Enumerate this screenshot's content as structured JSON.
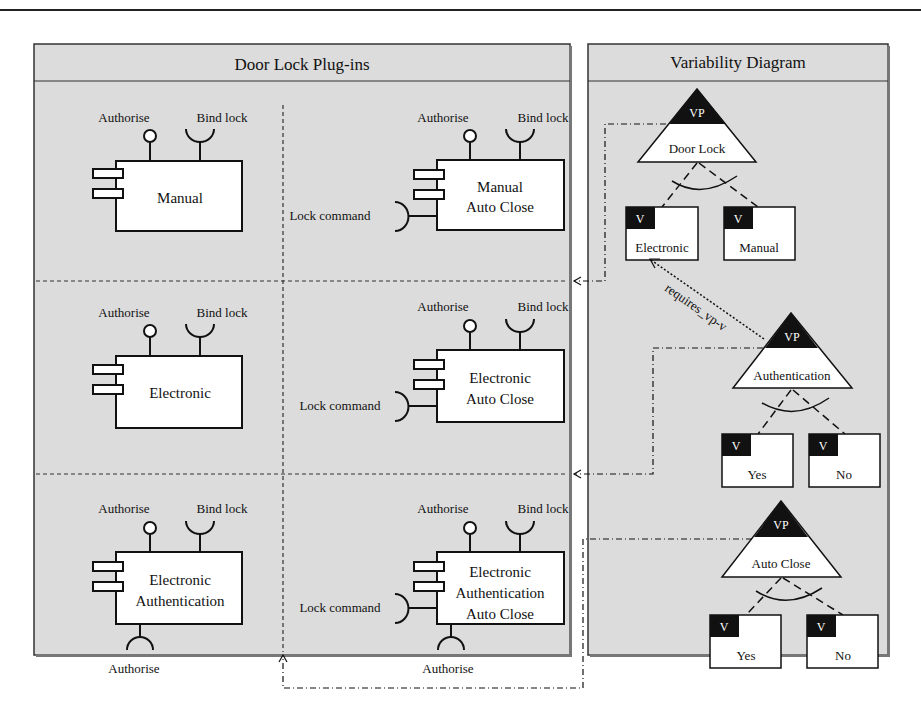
{
  "left_panel": {
    "title": "Door Lock Plug-ins",
    "components": [
      {
        "id": "manual",
        "lines": [
          "Manual"
        ],
        "provided": "Authorise",
        "required": "Bind lock"
      },
      {
        "id": "manual-auto-close",
        "lines": [
          "Manual",
          "Auto Close"
        ],
        "provided": "Authorise",
        "required": "Bind lock",
        "side": "Lock command"
      },
      {
        "id": "electronic",
        "lines": [
          "Electronic"
        ],
        "provided": "Authorise",
        "required": "Bind lock"
      },
      {
        "id": "electronic-auto-close",
        "lines": [
          "Electronic",
          "Auto Close"
        ],
        "provided": "Authorise",
        "required": "Bind lock",
        "side": "Lock command"
      },
      {
        "id": "electronic-authentication",
        "lines": [
          "Electronic",
          "Authentication"
        ],
        "provided": "Authorise",
        "required": "Bind lock",
        "bottom": "Authorise"
      },
      {
        "id": "electronic-authentication-auto-close",
        "lines": [
          "Electronic",
          "Authentication",
          "Auto Close"
        ],
        "provided": "Authorise",
        "required": "Bind lock",
        "side": "Lock command",
        "bottom": "Authorise"
      }
    ]
  },
  "right_panel": {
    "title": "Variability Diagram",
    "vp_label": "VP",
    "v_label": "V",
    "variation_points": [
      {
        "name": "Door Lock",
        "variants": [
          "Electronic",
          "Manual"
        ]
      },
      {
        "name": "Authentication",
        "variants": [
          "Yes",
          "No"
        ]
      },
      {
        "name": "Auto Close",
        "variants": [
          "Yes",
          "No"
        ]
      }
    ],
    "dependency_label": "requires_vp-v"
  }
}
